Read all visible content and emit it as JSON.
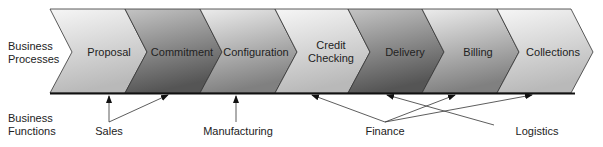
{
  "row_labels": {
    "processes": [
      "Business",
      "Processes"
    ],
    "functions": [
      "Business",
      "Functions"
    ]
  },
  "processes": [
    {
      "label": "Proposal",
      "shade": "light"
    },
    {
      "label": "Commitment",
      "shade": "dark"
    },
    {
      "label": "Configuration",
      "shade": "medium"
    },
    {
      "label": "Credit Checking",
      "line1": "Credit",
      "line2": "Checking",
      "shade": "light"
    },
    {
      "label": "Delivery",
      "shade": "dark"
    },
    {
      "label": "Billing",
      "shade": "medium"
    },
    {
      "label": "Collections",
      "shade": "light"
    }
  ],
  "functions": [
    {
      "label": "Sales",
      "targets": [
        "Proposal",
        "Commitment"
      ]
    },
    {
      "label": "Manufacturing",
      "targets": [
        "Configuration"
      ]
    },
    {
      "label": "Finance",
      "targets": [
        "Credit Checking",
        "Billing",
        "Collections"
      ]
    },
    {
      "label": "Logistics",
      "targets": [
        "Delivery"
      ]
    }
  ],
  "colors": {
    "light_top": "#f4f4f4",
    "light_bottom": "#bdbdbd",
    "dark_top": "#bcbcbc",
    "dark_bottom": "#5e5e5e",
    "medium_top": "#e6e6e6",
    "medium_bottom": "#8a8a8a",
    "outline": "#333333"
  }
}
